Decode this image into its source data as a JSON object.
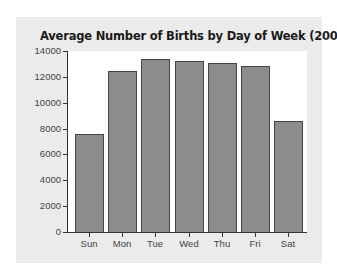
{
  "chart_data": {
    "type": "bar",
    "title": "Average Number of Births by Day of Week (2008)",
    "xlabel": "",
    "ylabel": "",
    "categories": [
      "Sun",
      "Mon",
      "Tue",
      "Wed",
      "Thu",
      "Fri",
      "Sat"
    ],
    "values": [
      7560,
      12420,
      13390,
      13190,
      13110,
      12860,
      8590
    ],
    "ylim": [
      0,
      14000
    ],
    "yticks": [
      "0",
      "2000",
      "4000",
      "6000",
      "8000",
      "10000",
      "12000",
      "14000"
    ],
    "grid": false,
    "legend": null,
    "colors": {
      "bar": "#8c8c8c",
      "bar_border": "#444444",
      "panel": "#ebebeb",
      "plot_bg": "#ffffff"
    }
  }
}
